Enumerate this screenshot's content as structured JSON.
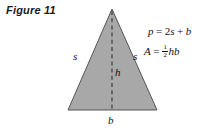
{
  "figure": {
    "caption": "Figure 11",
    "background_color": "#ffffff",
    "shape": {
      "name": "isosceles-triangle",
      "fill_color": "#a8a8a8",
      "stroke_color": "#555555",
      "apex": {
        "x": 112,
        "y": 9
      },
      "base_left": {
        "x": 68,
        "y": 110
      },
      "base_right": {
        "x": 157,
        "y": 110
      },
      "height_line": {
        "style": "dashed",
        "from": {
          "x": 112,
          "y": 9
        },
        "to": {
          "x": 112,
          "y": 110
        }
      }
    },
    "labels": {
      "side_left": "s",
      "side_right": "s",
      "height": "h",
      "base": "b"
    },
    "formulas": {
      "perimeter": {
        "lhs": "p",
        "equals": "=",
        "rhs_coefficient": "2",
        "rhs_side": "s",
        "plus": "+",
        "rhs_base": "b",
        "text": "p = 2s + b"
      },
      "area": {
        "lhs": "A",
        "equals": "=",
        "fraction_numerator": "1",
        "fraction_denominator": "2",
        "factors": "hb",
        "text": "A = 1/2 hb"
      }
    }
  }
}
